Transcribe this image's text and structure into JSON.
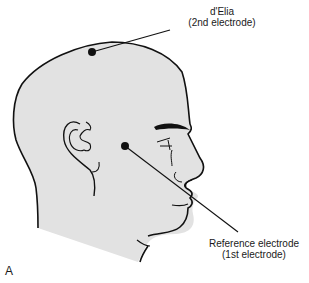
{
  "figure": {
    "panel_label": "A",
    "colors": {
      "skin": "#e2e2e2",
      "outline": "#111111",
      "background": "#ffffff"
    },
    "electrodes": [
      {
        "name": "d'Elia",
        "role": "(2nd electrode)",
        "position": "vertex / top of head"
      },
      {
        "name": "Reference electrode",
        "role": "(1st electrode)",
        "position": "cheek / temple area"
      }
    ]
  }
}
